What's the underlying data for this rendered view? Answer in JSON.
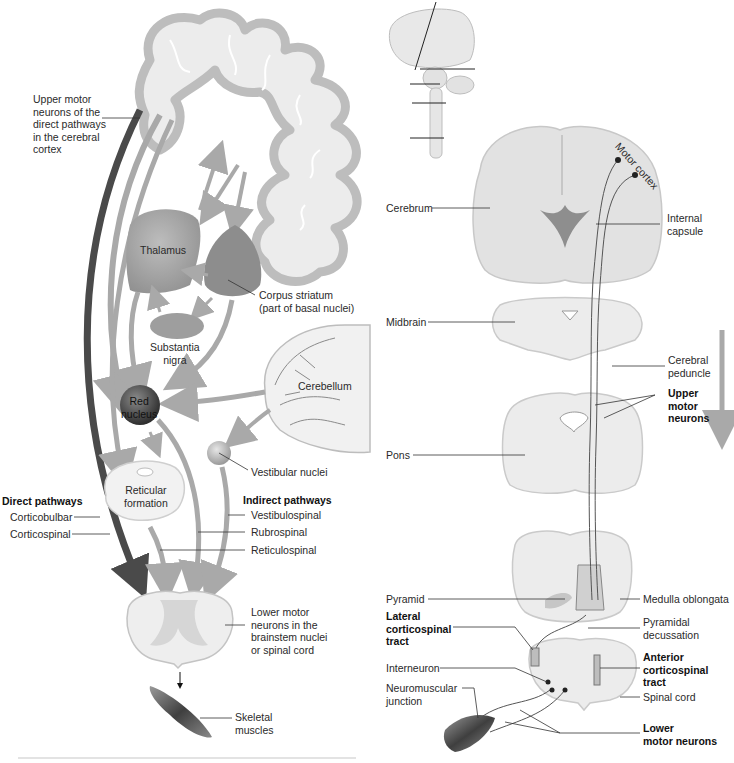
{
  "figure": {
    "left_panel": {
      "labels": {
        "upper_motor_neurons": "Upper motor\nneurons of the\ndirect pathways\nin the cerebral\ncortex",
        "thalamus": "Thalamus",
        "corpus_striatum": "Corpus striatum\n(part of basal nuclei)",
        "substantia_nigra": "Substantia\nnigra",
        "cerebellum": "Cerebellum",
        "red_nucleus": "Red\nnucleus",
        "vestibular_nuclei": "Vestibular nuclei",
        "reticular_formation": "Reticular\nformation",
        "direct_pathways_heading": "Direct pathways",
        "corticobulbar": "Corticobulbar",
        "corticospinal": "Corticospinal",
        "indirect_pathways_heading": "Indirect pathways",
        "vestibulospinal": "Vestibulospinal",
        "rubrospinal": "Rubrospinal",
        "reticulospinal": "Reticulospinal",
        "lower_motor_neurons": "Lower motor\nneurons in the\nbrainstem nuclei\nor spinal cord",
        "skeletal_muscles": "Skeletal\nmuscles"
      }
    },
    "right_panel": {
      "labels": {
        "motor_cortex": "Motor cortex",
        "cerebrum": "Cerebrum",
        "internal_capsule": "Internal\ncapsule",
        "midbrain": "Midbrain",
        "cerebral_peduncle": "Cerebral\npeduncle",
        "upper_motor_neurons": "Upper\nmotor\nneurons",
        "pons": "Pons",
        "pyramid": "Pyramid",
        "medulla_oblongata": "Medulla oblongata",
        "lateral_corticospinal_tract": "Lateral\ncorticospinal\ntract",
        "pyramidal_decussation": "Pyramidal\ndecussation",
        "interneuron": "Interneuron",
        "anterior_corticospinal_tract": "Anterior\ncorticospinal tract",
        "neuromuscular_junction": "Neuromuscular\njunction",
        "spinal_cord": "Spinal cord",
        "lower_motor_neurons": "Lower\nmotor neurons"
      }
    },
    "colors": {
      "tissue": "#d9d9d9",
      "tissue_light": "#ececec",
      "arrow": "#a9a9a9",
      "arrow_dark": "#555555",
      "outline": "#9a9a9a"
    }
  }
}
